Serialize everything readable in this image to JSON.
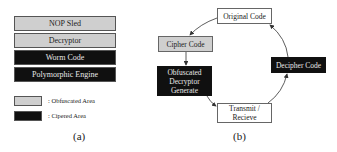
{
  "panel_a": {
    "stack": [
      {
        "label": "NOP Sled",
        "style": "obfuscated"
      },
      {
        "label": "Decryptor",
        "style": "obfuscated"
      },
      {
        "label": "Worm Code",
        "style": "ciphered"
      },
      {
        "label": "Polymorphic Engine",
        "style": "ciphered"
      }
    ],
    "legend": [
      {
        "label": ": Obfuscated Area",
        "color": "#cfcfcf"
      },
      {
        "label": ": Cipered Area",
        "color": "#101010"
      }
    ],
    "caption": "(a)"
  },
  "panel_b": {
    "nodes": {
      "original_code": "Original Code",
      "cipher_code": "Cipher Code",
      "obfuscated_line1": "Obfuscated",
      "obfuscated_line2": "Decryptor",
      "obfuscated_line3": "Generate",
      "decipher_code": "Decipher Code",
      "transmit_line1": "Transmit /",
      "transmit_line2": "Recieve"
    },
    "caption": "(b)"
  },
  "colors": {
    "obfuscated": "#cfcfcf",
    "ciphered": "#101010",
    "plain": "#ffffff"
  }
}
